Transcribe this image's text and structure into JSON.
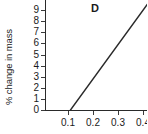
{
  "chart_data": {
    "type": "line",
    "title": "D",
    "panel_label": "D",
    "xlabel": "",
    "ylabel": "% change in mass",
    "xlim": [
      0.045,
      0.455
    ],
    "ylim": [
      0,
      9.6
    ],
    "grid": false,
    "legend": null,
    "x_tick_labels": [
      "0.1",
      "0.2",
      "0.3",
      "0.4"
    ],
    "x_tick_values": [
      0.1,
      0.2,
      0.3,
      0.4
    ],
    "y_tick_labels": [
      "0",
      "1",
      "2",
      "3",
      "4",
      "5",
      "6",
      "7",
      "8",
      "9"
    ],
    "y_tick_values": [
      0,
      1,
      2,
      3,
      4,
      5,
      6,
      7,
      8,
      9
    ],
    "series": [
      {
        "name": "% change in mass",
        "x": [
          0.11,
          0.42
        ],
        "values": [
          0.0,
          9.6
        ]
      }
    ],
    "line_color": "#2a2a2a",
    "background_color": "#ffffff",
    "x_intercept": 0.11,
    "annotations": []
  }
}
